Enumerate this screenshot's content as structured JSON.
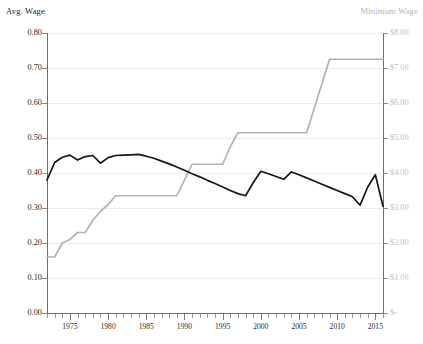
{
  "chart_data": {
    "type": "line",
    "title": "",
    "xlabel": "",
    "ylabel": "Avg. Wage",
    "y2label": "Minimum Wage",
    "grid": true,
    "legend_position": "axis-titles",
    "xlim": [
      1972,
      2016
    ],
    "ylim": [
      0.0,
      0.8
    ],
    "y2lim": [
      0,
      8
    ],
    "x_tick_labels": [
      "1975",
      "1980",
      "1985",
      "1990",
      "1995",
      "2000",
      "2005",
      "2010",
      "2015"
    ],
    "x_tick_values": [
      1975,
      1980,
      1985,
      1990,
      1995,
      2000,
      2005,
      2010,
      2015
    ],
    "x_minor_tick_step": 1,
    "y_tick_labels": [
      "0.00",
      "0.10",
      "0.20",
      "0.30",
      "0.40",
      "0.50",
      "0.60",
      "0.70",
      "0.80"
    ],
    "y_tick_values": [
      0.0,
      0.1,
      0.2,
      0.3,
      0.4,
      0.5,
      0.6,
      0.7,
      0.8
    ],
    "y2_tick_labels": [
      "$-",
      "$1.00",
      "$2.00",
      "$3.00",
      "$4.00",
      "$5.00",
      "$6.00",
      "$7.00",
      "$8.00"
    ],
    "y2_tick_values": [
      0,
      1,
      2,
      3,
      4,
      5,
      6,
      7,
      8
    ],
    "colors": {
      "avg_wage_line": "#161616",
      "minimum_wage_line": "#b3b3b3",
      "gridline": "#ececec",
      "axis": "#6e6e6e",
      "left_axis_text": "#2a2a2a",
      "right_axis_text": "#c0c0c0"
    },
    "x": [
      1972,
      1973,
      1974,
      1975,
      1976,
      1977,
      1978,
      1979,
      1980,
      1981,
      1982,
      1983,
      1984,
      1985,
      1986,
      1987,
      1988,
      1989,
      1990,
      1991,
      1992,
      1993,
      1994,
      1995,
      1996,
      1997,
      1998,
      1999,
      2000,
      2001,
      2002,
      2003,
      2004,
      2005,
      2006,
      2007,
      2008,
      2009,
      2010,
      2011,
      2012,
      2013,
      2014,
      2015,
      2016
    ],
    "series": [
      {
        "name": "Avg. Wage",
        "axis": "left",
        "color": "#161616",
        "values": [
          0.38,
          0.43,
          0.445,
          0.451,
          0.437,
          0.447,
          0.45,
          0.428,
          0.444,
          0.45,
          0.451,
          0.452,
          0.453,
          0.448,
          0.442,
          0.434,
          0.426,
          0.417,
          0.408,
          0.398,
          0.389,
          0.379,
          0.37,
          0.36,
          0.35,
          0.341,
          0.335,
          0.372,
          0.405,
          0.398,
          0.39,
          0.382,
          0.403,
          0.395,
          0.386,
          0.377,
          0.368,
          0.359,
          0.35,
          0.341,
          0.332,
          0.308,
          0.36,
          0.395,
          0.305
        ]
      },
      {
        "name": "Minimum Wage",
        "axis": "right",
        "color": "#b3b3b3",
        "values": [
          1.6,
          1.6,
          2.0,
          2.1,
          2.3,
          2.3,
          2.65,
          2.9,
          3.1,
          3.35,
          3.35,
          3.35,
          3.35,
          3.35,
          3.35,
          3.35,
          3.35,
          3.35,
          3.8,
          4.25,
          4.25,
          4.25,
          4.25,
          4.25,
          4.75,
          5.15,
          5.15,
          5.15,
          5.15,
          5.15,
          5.15,
          5.15,
          5.15,
          5.15,
          5.15,
          5.85,
          6.55,
          7.25,
          7.25,
          7.25,
          7.25,
          7.25,
          7.25,
          7.25,
          7.25
        ]
      }
    ]
  },
  "labels": {
    "left_axis_title": "Avg. Wage",
    "right_axis_title": "Minimum Wage"
  },
  "caption": {
    "text": ""
  }
}
